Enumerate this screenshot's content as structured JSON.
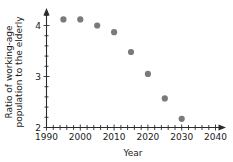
{
  "chart_data": {
    "type": "scatter",
    "title": "",
    "xlabel": "Year",
    "ylabel": "Ratio of working-age population to the elderly",
    "ylabel_line1": "Ratio of working-age",
    "ylabel_line2": "population to the elderly",
    "x": [
      1995,
      2000,
      2005,
      2010,
      2015,
      2020,
      2025,
      2030
    ],
    "values": [
      4.12,
      4.12,
      4.0,
      3.87,
      3.48,
      3.05,
      2.57,
      2.17
    ],
    "xlim": [
      1990,
      2040
    ],
    "ylim": [
      2,
      4.3
    ],
    "xticks": [
      1990,
      2000,
      2010,
      2020,
      2030,
      2040
    ],
    "xtick_labels": [
      "1990",
      "2000",
      "2010",
      "2020",
      "2030",
      "2040"
    ],
    "x_minor_step": 2,
    "yticks": [
      2,
      3,
      4
    ],
    "ytick_labels": [
      "2",
      "3",
      "4"
    ],
    "y_minor_step": 0.2,
    "grid": false,
    "legend": "none",
    "marker_color": "#7a7a7a",
    "axis_color": "#2b2b2b",
    "axis_arrows": true
  }
}
